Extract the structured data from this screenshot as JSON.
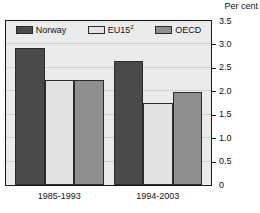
{
  "chart": {
    "unit_label": "Per cent",
    "axis": {
      "tick_labels": [
        "3.5",
        "3.0",
        "2.5",
        "2.0",
        "1.5",
        "1.0",
        "0.5",
        "0"
      ]
    },
    "legend": [
      {
        "label": "Norway",
        "color": "#4a4a4a",
        "icon": "legend-swatch-norway"
      },
      {
        "label": "EU15",
        "sup": "2",
        "color": "#e2e2e2",
        "icon": "legend-swatch-eu15"
      },
      {
        "label": "OECD",
        "color": "#8f8f8f",
        "icon": "legend-swatch-oecd"
      }
    ],
    "categories": [
      "1985-1993",
      "1994-2003"
    ]
  },
  "chart_data": {
    "type": "bar",
    "title": "",
    "subtitle": "",
    "xlabel": "",
    "ylabel": "Per cent",
    "ylim": [
      0,
      3.5
    ],
    "yticks": [
      0,
      0.5,
      1.0,
      1.5,
      2.0,
      2.5,
      3.0,
      3.5
    ],
    "ytick_labels": [
      "0",
      "0.5",
      "1.0",
      "1.5",
      "2.0",
      "2.5",
      "3.0",
      "3.5"
    ],
    "grid": true,
    "grid_axis": "y",
    "legend_position": "top-inside",
    "y_axis_side": "right",
    "categories": [
      "1985-1993",
      "1994-2003"
    ],
    "series": [
      {
        "name": "Norway",
        "color": "#4a4a4a",
        "values": [
          2.93,
          2.65
        ]
      },
      {
        "name": "EU15²",
        "color": "#e2e2e2",
        "values": [
          2.25,
          1.75
        ]
      },
      {
        "name": "OECD",
        "color": "#8f8f8f",
        "values": [
          2.25,
          1.98
        ]
      }
    ],
    "annotations": [
      "Per cent"
    ]
  }
}
